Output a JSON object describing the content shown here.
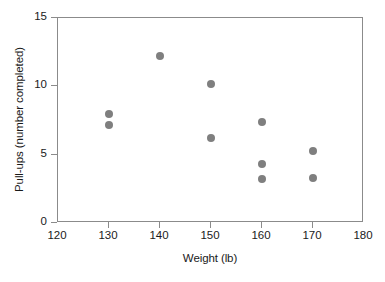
{
  "chart_data": {
    "type": "scatter",
    "title": "",
    "xlabel": "Weight (lb)",
    "ylabel": "Pull-ups (number completed)",
    "xlim": [
      120,
      180
    ],
    "ylim": [
      0,
      15
    ],
    "xticks": [
      120,
      130,
      140,
      150,
      160,
      170,
      180
    ],
    "yticks": [
      0,
      5,
      10,
      15
    ],
    "xtick_labels": [
      "120",
      "130",
      "140",
      "150",
      "160",
      "170",
      "180"
    ],
    "ytick_labels": [
      "0",
      "5",
      "10",
      "15"
    ],
    "grid": false,
    "legend": null,
    "marker_color": "#7f7f7f",
    "axis_color": "#8b8b8b",
    "text_color": "#1a1a1a",
    "points": [
      {
        "x": 130,
        "y": 8.0
      },
      {
        "x": 130,
        "y": 7.2
      },
      {
        "x": 140,
        "y": 12.2
      },
      {
        "x": 150,
        "y": 10.2
      },
      {
        "x": 150,
        "y": 6.2
      },
      {
        "x": 160,
        "y": 7.4
      },
      {
        "x": 160,
        "y": 4.3
      },
      {
        "x": 160,
        "y": 3.2
      },
      {
        "x": 170,
        "y": 5.3
      },
      {
        "x": 170,
        "y": 3.3
      }
    ]
  }
}
